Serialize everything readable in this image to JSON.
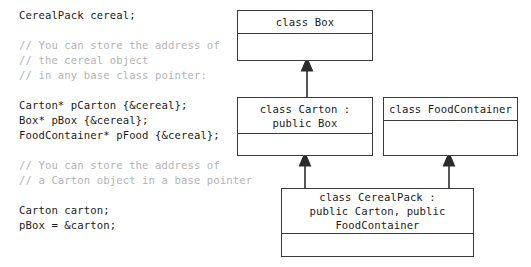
{
  "code_panel": {
    "lines": [
      {
        "text": "CerealPack cereal;",
        "kind": "code"
      },
      {
        "text": "",
        "kind": "blank"
      },
      {
        "text": "// You can store the address of",
        "kind": "comment"
      },
      {
        "text": "// the cereal object",
        "kind": "comment"
      },
      {
        "text": "// in any base class pointer:",
        "kind": "comment"
      },
      {
        "text": "",
        "kind": "blank"
      },
      {
        "text": "Carton* pCarton {&cereal};",
        "kind": "code"
      },
      {
        "text": "Box* pBox {&cereal};",
        "kind": "code"
      },
      {
        "text": "FoodContainer* pFood {&cereal};",
        "kind": "code"
      },
      {
        "text": "",
        "kind": "blank"
      },
      {
        "text": "// You can store the address of",
        "kind": "comment"
      },
      {
        "text": "// a Carton object in a base pointer",
        "kind": "comment"
      },
      {
        "text": "",
        "kind": "blank"
      },
      {
        "text": "Carton carton;",
        "kind": "code"
      },
      {
        "text": "pBox = &carton;",
        "kind": "code"
      }
    ]
  },
  "diagram": {
    "classes": {
      "box": {
        "title": "class Box"
      },
      "carton": {
        "title": "class Carton :\npublic Box"
      },
      "food_container": {
        "title": "class FoodContainer"
      },
      "cereal_pack": {
        "title": "class CerealPack :\npublic Carton, public\nFoodContainer"
      }
    },
    "relations": [
      {
        "name": "carton-inherits-box",
        "from": "carton",
        "to": "box",
        "kind": "inheritance"
      },
      {
        "name": "cerealpack-inherits-carton",
        "from": "cereal_pack",
        "to": "carton",
        "kind": "inheritance"
      },
      {
        "name": "cerealpack-inherits-foodcontainer",
        "from": "cereal_pack",
        "to": "food_container",
        "kind": "inheritance"
      }
    ]
  },
  "colors": {
    "background": "#ffffff",
    "code_text": "#1a1a1a",
    "comment_text": "#b3b3b3",
    "box_border": "#3a3a3a",
    "connector": "#2b2b2b"
  }
}
